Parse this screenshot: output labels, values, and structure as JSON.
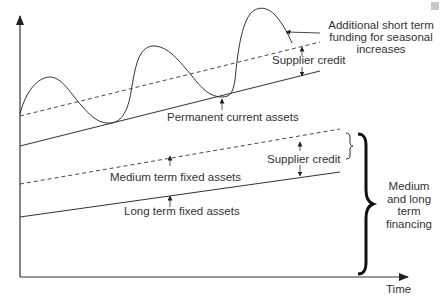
{
  "figure": {
    "axes": {
      "x_label": "Time",
      "y_label": ""
    },
    "labels": {
      "short_term_line1": "Additional short term",
      "short_term_line2": "funding for seasonal",
      "short_term_line3": "increases",
      "supplier_credit_top": "Supplier credit",
      "permanent_current_assets": "Permanent current assets",
      "supplier_credit_bottom": "Supplier credit",
      "medium_term_fixed_assets": "Medium term fixed assets",
      "long_term_fixed_assets": "Long term fixed assets",
      "financing_line1": "Medium",
      "financing_line2": "and long",
      "financing_line3": "term",
      "financing_line4": "financing"
    },
    "colors": {
      "line": "#333333",
      "text": "#333333",
      "brace": "#111111"
    }
  }
}
